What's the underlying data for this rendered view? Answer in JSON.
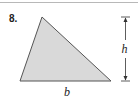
{
  "problem": {
    "number": "8."
  },
  "figure": {
    "shape": "triangle",
    "fill_color": "#d9d9d9",
    "stroke_color": "#555555",
    "vertices": {
      "apex": [
        42,
        17
      ],
      "bottom_left": [
        20,
        81
      ],
      "bottom_right": [
        111,
        81
      ]
    },
    "base_label": "b",
    "height_label": "h"
  }
}
